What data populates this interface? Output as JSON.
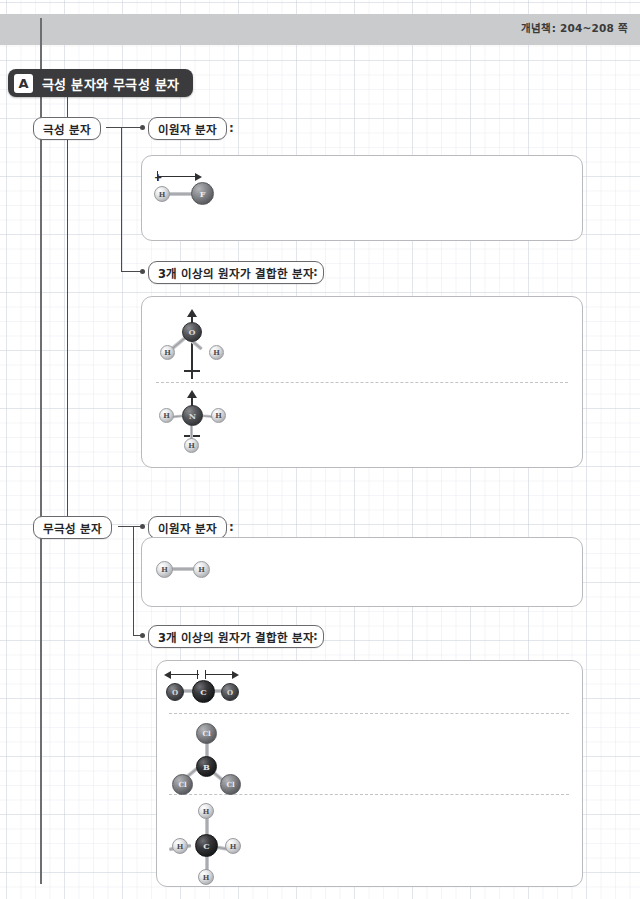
{
  "header": {
    "page_reference": "개념책: 204~208 쪽"
  },
  "title": {
    "badge": "A",
    "text": "극성 분자와 무극성 분자"
  },
  "branches": [
    {
      "label": "극성 분자",
      "children": [
        {
          "label": "이원자 분자",
          "colon": ":"
        },
        {
          "label": "3개 이상의 원자가 결합한 분자",
          "colon": ":"
        }
      ]
    },
    {
      "label": "무극성 분자",
      "children": [
        {
          "label": "이원자 분자",
          "colon": ":"
        },
        {
          "label": "3개 이상의 원자가 결합한 분자",
          "colon": ":"
        }
      ]
    }
  ],
  "molecules": {
    "hf": {
      "name": "HF",
      "atoms": [
        "H",
        "F"
      ],
      "dipole": "+→"
    },
    "h2o": {
      "name": "H2O",
      "atoms": [
        "O",
        "H",
        "H"
      ],
      "dipole": "↑"
    },
    "nh3": {
      "name": "NH3",
      "atoms": [
        "N",
        "H",
        "H",
        "H"
      ],
      "dipole": "↑"
    },
    "h2": {
      "name": "H2",
      "atoms": [
        "H",
        "H"
      ]
    },
    "co2": {
      "name": "CO2",
      "atoms": [
        "O",
        "C",
        "O"
      ],
      "dipole": "←→"
    },
    "bcl3": {
      "name": "BCl3",
      "atoms": [
        "B",
        "Cl",
        "Cl",
        "Cl"
      ]
    },
    "ch4": {
      "name": "CH4",
      "atoms": [
        "C",
        "H",
        "H",
        "H",
        "H"
      ]
    }
  },
  "atom_labels": {
    "H": "H",
    "F": "F",
    "O": "O",
    "N": "N",
    "C": "C",
    "B": "B",
    "Cl": "Cl"
  },
  "colors": {
    "band": "#c9cbcd",
    "title_bg": "#3b3b3d",
    "line": "#4a4a4c",
    "panel_border": "#b9babd",
    "grid": "#c8cdd7"
  }
}
